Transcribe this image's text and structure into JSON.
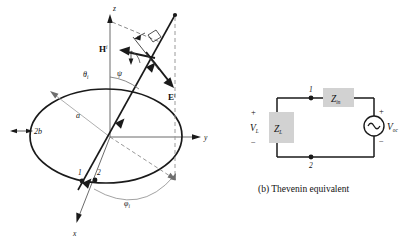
{
  "figure": {
    "background_color": "#ffffff",
    "line_color": "#1a1a1a",
    "accent_gray": "#8a8a8a",
    "box_fill": "#d2d2d2",
    "panels": [
      {
        "id": "panel-a",
        "caption": ""
      },
      {
        "id": "panel-b",
        "caption": "(b) Thevenin equivalent"
      }
    ]
  },
  "loop_diagram": {
    "name": "incident-plane-wave-on-loop-antenna",
    "axes": {
      "z_label": "z",
      "y_label": "y",
      "x_label": "x"
    },
    "dimension_labels": {
      "radius": "a",
      "wire_diameter": "2b"
    },
    "field_vectors": [
      {
        "name": "magnetic-field-vector",
        "base": "H",
        "superscript": "i"
      },
      {
        "name": "electric-field-vector",
        "base": "E",
        "superscript": "i"
      }
    ],
    "angles": [
      {
        "name": "theta-incidence",
        "base": "θ",
        "subscript": "i"
      },
      {
        "name": "psi-polarization",
        "base": "ψ",
        "subscript": ""
      },
      {
        "name": "phi-incidence",
        "base": "φ",
        "subscript": "i"
      }
    ],
    "terminals": [
      {
        "name": "terminal-1",
        "label": "1"
      },
      {
        "name": "terminal-2",
        "label": "2"
      }
    ]
  },
  "circuit": {
    "caption": "(b) Thevenin equivalent",
    "components": [
      {
        "name": "input-impedance",
        "base": "Z",
        "subscript": "in"
      },
      {
        "name": "load-impedance",
        "base": "Z",
        "subscript": "L"
      },
      {
        "name": "open-circuit-voltage-source",
        "base": "V",
        "subscript": "oc"
      }
    ],
    "load_voltage": {
      "base": "V",
      "subscript": "L"
    },
    "polarity": {
      "plus": "+",
      "minus": "−"
    },
    "nodes": [
      {
        "name": "node-1",
        "label": "1"
      },
      {
        "name": "node-2",
        "label": "2"
      }
    ],
    "source_symbol": "ac-sine-source"
  }
}
